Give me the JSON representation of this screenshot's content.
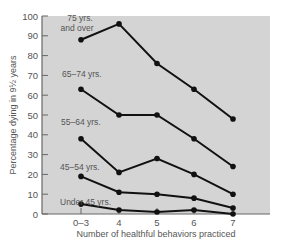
{
  "chart_data": {
    "type": "line",
    "title": "",
    "xlabel": "Number of healthful behaviors practiced",
    "ylabel": "Percentage dying in 9½ years",
    "categories": [
      "0–3",
      "4",
      "5",
      "6",
      "7"
    ],
    "ylim": [
      0,
      100
    ],
    "yticks": [
      0,
      10,
      20,
      30,
      40,
      50,
      60,
      70,
      80,
      90,
      100
    ],
    "grid": false,
    "legend": "inline labels",
    "series": [
      {
        "name": "75 yrs. and over",
        "label_lines": [
          "75 yrs.",
          "and over"
        ],
        "values": [
          88,
          96,
          76,
          63,
          48
        ]
      },
      {
        "name": "65–74 yrs.",
        "label_lines": [
          "65–74 yrs."
        ],
        "values": [
          63,
          50,
          50,
          38,
          24
        ]
      },
      {
        "name": "55–64 yrs.",
        "label_lines": [
          "55–64 yrs."
        ],
        "values": [
          38,
          21,
          28,
          20,
          10
        ]
      },
      {
        "name": "45–54 yrs.",
        "label_lines": [
          "45–54 yrs."
        ],
        "values": [
          19,
          11,
          10,
          8,
          3
        ]
      },
      {
        "name": "Under 45 yrs.",
        "label_lines": [
          "Under 45 yrs."
        ],
        "values": [
          5,
          2,
          1,
          2,
          0
        ]
      }
    ],
    "colors": {
      "plot_bg": "#d4d4d4",
      "line": "#111111",
      "text": "#555555"
    }
  }
}
